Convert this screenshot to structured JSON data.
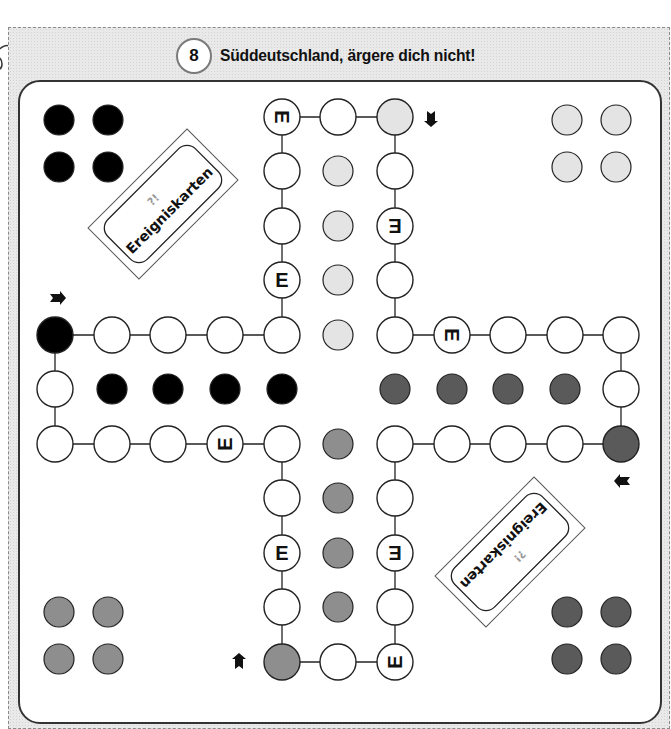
{
  "header": {
    "number": "8",
    "title": "Süddeutschland, ärgere dich nicht!"
  },
  "colors": {
    "black": "#000000",
    "light_gray": "#e4e4e4",
    "mid_gray": "#8e8e8e",
    "dark_gray": "#5a5a5a",
    "field": "#ffffff",
    "stroke": "#222222"
  },
  "event_cards": [
    {
      "label": "Ereigniskarten",
      "symbol": "?!"
    },
    {
      "label": "Ereigniskarten",
      "symbol": "?!"
    }
  ],
  "event_field_letter": "E",
  "players": [
    {
      "color": "black",
      "corner": "top-left"
    },
    {
      "color": "light_gray",
      "corner": "top-right"
    },
    {
      "color": "dark_gray",
      "corner": "bottom-right"
    },
    {
      "color": "mid_gray",
      "corner": "bottom-left"
    }
  ]
}
